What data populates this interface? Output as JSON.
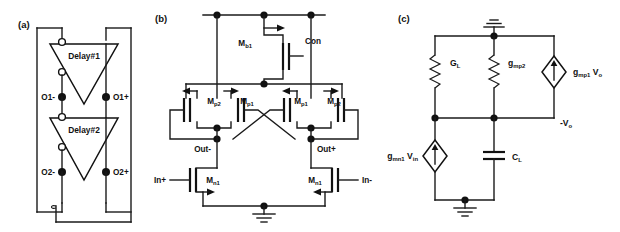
{
  "figure": {
    "type": "circuit-schematic-figure",
    "width": 620,
    "height": 232,
    "background": "#ffffff",
    "ink": "#111111"
  },
  "panels": [
    {
      "id": "a",
      "label": "(a)",
      "title": "two-stage differential ring oscillator",
      "blocks": [
        {
          "name": "delay1",
          "label": "Delay#1",
          "shape": "inverting-triangle"
        },
        {
          "name": "delay2",
          "label": "Delay#2",
          "shape": "inverting-triangle"
        }
      ],
      "terminals": [
        {
          "name": "o1-minus",
          "label": "O1-",
          "side": "left"
        },
        {
          "name": "o1-plus",
          "label": "O1+",
          "side": "right"
        },
        {
          "name": "o2-minus",
          "label": "O2-",
          "side": "left"
        },
        {
          "name": "o2-plus",
          "label": "O2+",
          "side": "right"
        }
      ]
    },
    {
      "id": "b",
      "label": "(b)",
      "title": "differential delay cell transistor schematic",
      "transistors": [
        {
          "name": "mb1",
          "base": "M",
          "sub": "b1",
          "type": "pmos",
          "gate_label": "Con"
        },
        {
          "name": "mp2-left",
          "base": "M",
          "sub": "p2",
          "type": "pmos"
        },
        {
          "name": "mp1-left",
          "base": "M",
          "sub": "p1",
          "type": "pmos"
        },
        {
          "name": "mp1-right",
          "base": "M",
          "sub": "p1",
          "type": "pmos"
        },
        {
          "name": "mp2-right",
          "base": "M",
          "sub": "p2",
          "type": "pmos"
        },
        {
          "name": "mn1-left",
          "base": "M",
          "sub": "n1",
          "type": "nmos"
        },
        {
          "name": "mn1-right",
          "base": "M",
          "sub": "n1",
          "type": "nmos"
        }
      ],
      "nets": [
        {
          "name": "control",
          "label": "Con"
        },
        {
          "name": "out-minus",
          "label": "Out-"
        },
        {
          "name": "out-plus",
          "label": "Out+"
        },
        {
          "name": "in-plus",
          "label": "In+"
        },
        {
          "name": "in-minus",
          "label": "In-"
        }
      ],
      "symbols": [
        {
          "name": "ground-symbol",
          "label": "ground"
        }
      ]
    },
    {
      "id": "c",
      "label": "(c)",
      "title": "small-signal equivalent half circuit",
      "elements": [
        {
          "name": "conductance-gl",
          "base": "G",
          "sub": "L",
          "kind": "resistor"
        },
        {
          "name": "conductance-gmp2",
          "base": "g",
          "sub": "mp2",
          "kind": "resistor"
        },
        {
          "name": "source-gmp1-vo",
          "base": "g",
          "sub": "mp1",
          "tail": "V",
          "tail_sub": "o",
          "kind": "current-source"
        },
        {
          "name": "source-gmn1-vin",
          "base": "g",
          "sub": "mn1",
          "tail": "V",
          "tail_sub": "in",
          "kind": "current-source"
        },
        {
          "name": "capacitor-cl",
          "base": "C",
          "sub": "L",
          "kind": "capacitor"
        }
      ],
      "nets": [
        {
          "name": "output-node",
          "base": "-V",
          "sub": "o"
        }
      ],
      "symbols": [
        {
          "name": "ground-symbol-top",
          "label": "ground"
        },
        {
          "name": "ground-symbol-bottom",
          "label": "ground"
        }
      ]
    }
  ]
}
